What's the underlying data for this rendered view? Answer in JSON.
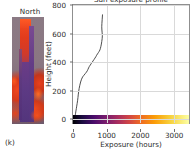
{
  "figure": {
    "subfigure_label": "(k)"
  },
  "photo_panel": {
    "title": "North",
    "name": "thermal-image"
  },
  "chart_data": {
    "type": "line",
    "title": "Sun exposure profile",
    "xlabel": "Exposure (hours)",
    "ylabel": "Height (feet)",
    "xlim": [
      0,
      3500
    ],
    "ylim": [
      -40,
      800
    ],
    "grid": true,
    "legend": null,
    "line_color": "#3a3a3a",
    "xticks": [
      0,
      1000,
      2000,
      3000
    ],
    "xtick_labels": [
      "0",
      "1000",
      "2000",
      "3000"
    ],
    "yticks": [
      0,
      200,
      400,
      600,
      800
    ],
    "ytick_labels": [
      "0",
      "200",
      "400",
      "600",
      "800"
    ],
    "x": [
      55,
      62,
      70,
      78,
      88,
      100,
      112,
      126,
      140,
      150,
      158,
      170,
      185,
      205,
      230,
      258,
      290,
      330,
      372,
      405,
      432,
      452,
      470,
      492,
      520,
      548,
      578,
      605,
      635,
      662,
      690,
      712,
      740,
      768,
      790,
      812,
      828,
      842,
      856,
      868,
      880,
      886,
      880,
      872,
      868,
      872,
      880,
      890
    ],
    "y": [
      0,
      8,
      18,
      30,
      45,
      62,
      80,
      100,
      122,
      142,
      160,
      182,
      205,
      228,
      252,
      272,
      288,
      300,
      312,
      322,
      332,
      342,
      352,
      362,
      372,
      382,
      392,
      402,
      412,
      422,
      432,
      442,
      452,
      462,
      470,
      480,
      492,
      506,
      522,
      540,
      560,
      582,
      602,
      622,
      645,
      668,
      695,
      730
    ],
    "colorbar": {
      "colormap": "inferno",
      "position": "at y=0 spanning full x-range",
      "vmin": 0,
      "vmax": 3500,
      "stops": [
        "#000004",
        "#1b0c41",
        "#4a0c6b",
        "#781c6d",
        "#a52c60",
        "#cf4446",
        "#ed6925",
        "#fb9b06",
        "#f7d13d",
        "#fcffa4"
      ]
    }
  }
}
